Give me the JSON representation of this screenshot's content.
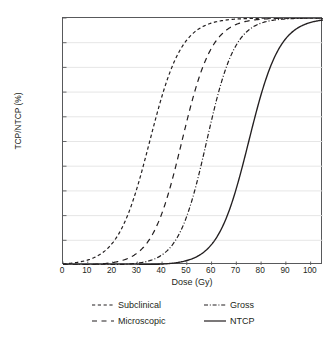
{
  "chart_data": {
    "type": "line",
    "title": "",
    "xlabel": "Dose (Gy)",
    "ylabel": "TCP/NTCP (%)",
    "xlim": [
      0,
      105
    ],
    "ylim": [
      0,
      100
    ],
    "xticks": [
      0,
      10,
      20,
      30,
      40,
      50,
      60,
      70,
      80,
      90,
      100
    ],
    "yticks": [
      0,
      10,
      20,
      30,
      40,
      50,
      60,
      70,
      80,
      90,
      100
    ],
    "grid": "horizontal",
    "legend_position": "below",
    "series": [
      {
        "name": "Subclinical",
        "linestyle": "short-dash",
        "color": "#231f20",
        "d50": 35,
        "slope_k": 0.155,
        "x": [
          0,
          5,
          10,
          15,
          20,
          25,
          30,
          35,
          40,
          45,
          50,
          55,
          60,
          65,
          70,
          75,
          80,
          85,
          90,
          95,
          100,
          105
        ],
        "y": [
          0.5,
          1.1,
          2.3,
          4.9,
          10.0,
          19.4,
          33.6,
          50.0,
          66.4,
          79.5,
          88.6,
          94.1,
          97.1,
          98.6,
          99.3,
          99.7,
          99.8,
          99.9,
          100,
          100,
          100,
          100
        ]
      },
      {
        "name": "Microscopic",
        "linestyle": "long-dash",
        "color": "#231f20",
        "d50": 48,
        "slope_k": 0.165,
        "x": [
          0,
          5,
          10,
          15,
          20,
          25,
          30,
          35,
          40,
          45,
          50,
          55,
          60,
          65,
          70,
          75,
          80,
          85,
          90,
          95,
          100,
          105
        ],
        "y": [
          0.4,
          0.8,
          1.4,
          2.6,
          4.8,
          8.8,
          15.6,
          26.0,
          39.8,
          55.4,
          69.7,
          81.0,
          88.9,
          93.9,
          96.8,
          98.4,
          99.2,
          99.6,
          99.8,
          99.9,
          100,
          100
        ]
      },
      {
        "name": "Gross",
        "linestyle": "dash-dot",
        "color": "#231f20",
        "d50": 58,
        "slope_k": 0.175,
        "x": [
          0,
          5,
          10,
          15,
          20,
          25,
          30,
          35,
          40,
          45,
          50,
          55,
          60,
          65,
          70,
          75,
          80,
          85,
          90,
          95,
          100,
          105
        ],
        "y": [
          0.3,
          0.5,
          0.9,
          1.5,
          2.6,
          4.4,
          7.5,
          12.5,
          20.2,
          31.0,
          44.1,
          57.9,
          70.4,
          80.4,
          87.7,
          92.6,
          95.7,
          97.6,
          98.7,
          99.3,
          99.6,
          99.8
        ]
      },
      {
        "name": "NTCP",
        "linestyle": "solid",
        "color": "#231f20",
        "d50": 75,
        "slope_k": 0.16,
        "x": [
          0,
          5,
          10,
          15,
          20,
          25,
          30,
          35,
          40,
          45,
          50,
          55,
          60,
          65,
          70,
          75,
          80,
          85,
          90,
          95,
          100,
          105
        ],
        "y": [
          0.2,
          0.3,
          0.5,
          0.8,
          1.3,
          2.2,
          3.6,
          5.9,
          9.5,
          15.0,
          23.0,
          33.5,
          45.8,
          58.6,
          70.3,
          80.0,
          87.2,
          92.2,
          95.4,
          97.4,
          98.6,
          99.2
        ]
      }
    ]
  },
  "axes": {
    "y_tick_labels": [
      "100",
      "90",
      "80",
      "70",
      "60",
      "50",
      "40",
      "30",
      "20",
      "10",
      "0"
    ],
    "x_tick_labels": [
      "0",
      "10",
      "20",
      "30",
      "40",
      "50",
      "60",
      "70",
      "80",
      "90",
      "100"
    ],
    "x_axis_title": "Dose (Gy)",
    "y_axis_title": "TCP/NTCP (%)"
  },
  "legend": {
    "items": [
      {
        "label": "Subclinical",
        "style": "short-dash"
      },
      {
        "label": "Gross",
        "style": "dash-dot"
      },
      {
        "label": "Microscopic",
        "style": "long-dash"
      },
      {
        "label": "NTCP",
        "style": "solid"
      }
    ]
  },
  "colors": {
    "line": "#231f20",
    "grid": "#e3e3e3",
    "axis": "#58595b",
    "background": "#ffffff"
  }
}
